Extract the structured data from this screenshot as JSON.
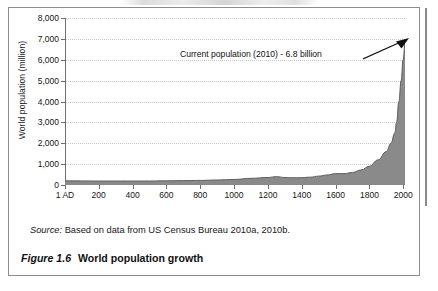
{
  "figure": {
    "caption_number": "Figure 1.6",
    "caption_title": "World population growth",
    "source_label": "Source:",
    "source_text": "Based on data from US Census Bureau 2010a, 2010b."
  },
  "colors": {
    "area_fill": "#8a8a8a",
    "area_stroke": "#5e5e5e",
    "axis": "#6f6f6f",
    "grid": "#c9c9c9",
    "frame": "#8d8d8d",
    "text": "#151515"
  },
  "chart_data": {
    "type": "area",
    "title": "World population growth",
    "xlabel": "",
    "ylabel": "World population (million)",
    "xlim": [
      1,
      2010
    ],
    "ylim": [
      0,
      8000
    ],
    "grid": true,
    "legend": "none",
    "ytick_labels": [
      "0",
      "1,000",
      "2,000",
      "3,000",
      "4,000",
      "5,000",
      "6,000",
      "7,000",
      "8,000"
    ],
    "ytick_values": [
      0,
      1000,
      2000,
      3000,
      4000,
      5000,
      6000,
      7000,
      8000
    ],
    "xtick_labels": [
      "1 AD",
      "200",
      "400",
      "600",
      "800",
      "1000",
      "1200",
      "1400",
      "1600",
      "1800",
      "2000"
    ],
    "xtick_values": [
      1,
      200,
      400,
      600,
      800,
      1000,
      1200,
      1400,
      1600,
      1800,
      2000
    ],
    "x": [
      1,
      100,
      200,
      300,
      400,
      500,
      600,
      700,
      800,
      900,
      1000,
      1100,
      1200,
      1250,
      1300,
      1340,
      1400,
      1450,
      1500,
      1550,
      1600,
      1650,
      1700,
      1750,
      1800,
      1850,
      1900,
      1927,
      1950,
      1960,
      1974,
      1987,
      1999,
      2010
    ],
    "values": [
      200,
      195,
      190,
      190,
      190,
      190,
      200,
      210,
      220,
      240,
      265,
      320,
      360,
      400,
      360,
      350,
      350,
      375,
      425,
      480,
      545,
      545,
      600,
      720,
      900,
      1200,
      1600,
      2000,
      2500,
      3000,
      4000,
      5000,
      6000,
      6800
    ],
    "annotations": [
      {
        "text": "Current population (2010) - 6.8 billion",
        "x": 2010,
        "y": 6800,
        "arrow": true
      }
    ]
  }
}
